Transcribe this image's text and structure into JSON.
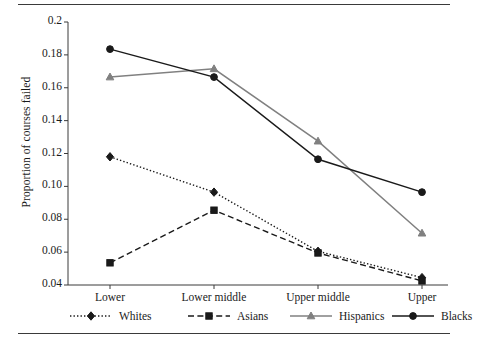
{
  "chart_data": {
    "type": "line",
    "title": "",
    "xlabel": "",
    "ylabel": "Proportion of courses failed",
    "categories": [
      "Lower",
      "Lower middle",
      "Upper middle",
      "Upper"
    ],
    "ylim": [
      0.04,
      0.2
    ],
    "yticks": [
      "0.04",
      "0.06",
      "0.08",
      "0.10",
      "0.12",
      "0.14",
      "0.16",
      "0.18",
      "0.2"
    ],
    "ytick_values": [
      0.04,
      0.06,
      0.08,
      0.1,
      0.12,
      0.14,
      0.16,
      0.18,
      0.2
    ],
    "grid": false,
    "legend_position": "bottom",
    "series": [
      {
        "name": "Whites",
        "values": [
          0.118,
          0.0965,
          0.0605,
          0.0445
        ],
        "color": "#1a1a1a",
        "line_style": "dotted",
        "marker": "diamond"
      },
      {
        "name": "Asians",
        "values": [
          0.0535,
          0.0855,
          0.0595,
          0.0425
        ],
        "color": "#1a1a1a",
        "line_style": "dashed",
        "marker": "square"
      },
      {
        "name": "Hispanics",
        "values": [
          0.1665,
          0.1715,
          0.1275,
          0.0715
        ],
        "color": "#808080",
        "line_style": "solid",
        "marker": "triangle"
      },
      {
        "name": "Blacks",
        "values": [
          0.1835,
          0.1665,
          0.1165,
          0.0965
        ],
        "color": "#1a1a1a",
        "line_style": "solid",
        "marker": "circle"
      }
    ]
  },
  "axis": {
    "y_label": "Proportion of courses failed"
  },
  "legend": {
    "items": [
      {
        "label": "Whites"
      },
      {
        "label": "Asians"
      },
      {
        "label": "Hispanics"
      },
      {
        "label": "Blacks"
      }
    ]
  }
}
